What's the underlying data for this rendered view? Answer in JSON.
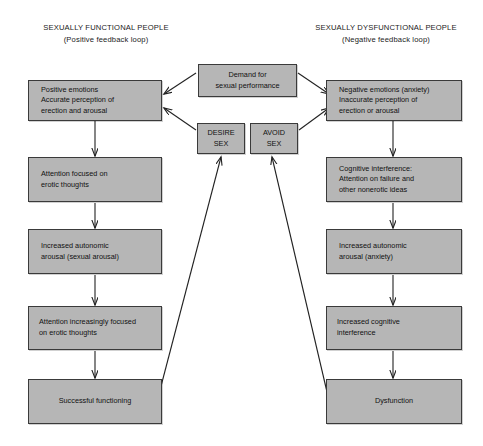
{
  "headers": {
    "left": {
      "title": "SEXUALLY FUNCTIONAL PEOPLE",
      "subtitle": "(Positive feedback loop)"
    },
    "right": {
      "title": "SEXUALLY DYSFUNCTIONAL PEOPLE",
      "subtitle": "(Negative feedback loop)"
    }
  },
  "center": {
    "demand": "Demand for\nsexual performance",
    "desire": "DESIRE\nSEX",
    "avoid": "AVOID\nSEX"
  },
  "left_chain": [
    "Positive emotions\nAccurate perception of\nerection and arousal",
    "Attention focused on\nerotic thoughts",
    "Increased autonomic\narousal (sexual arousal)",
    "Attention increasingly focused\non erotic thoughts",
    "Successful functioning"
  ],
  "right_chain": [
    "Negative emotions (anxiety)\nInaccurate perception of\nerection or arousal",
    "Cognitive interference:\nAttention on failure and\nother nonerotic ideas",
    "Increased autonomic\narousal (anxiety)",
    "Increased cognitive\ninterference",
    "Dysfunction"
  ],
  "colors": {
    "box_fill": "#b6b6b6",
    "box_border": "#3a3a3a",
    "arrow": "#222222",
    "text": "#111111",
    "background": "#ffffff"
  }
}
